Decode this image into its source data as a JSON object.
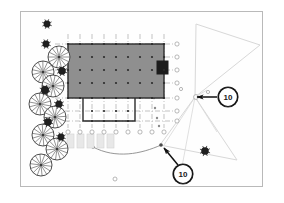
{
  "sheet": {
    "background_color": "#ffffff",
    "frame_border_color": "#b9b9b9",
    "drawing_type": "architectural-site-plan"
  },
  "callouts": [
    {
      "id": "callout-upper",
      "label": "10",
      "cx": 207,
      "cy": 85,
      "radius": 9.5,
      "arrow_from_x": 196,
      "arrow_from_y": 85,
      "arrow_to_x": 176,
      "arrow_to_y": 85,
      "target_x": 172,
      "target_y": 85
    },
    {
      "id": "callout-lower",
      "label": "10",
      "cx": 162,
      "cy": 162,
      "radius": 9.5,
      "arrow_from_x": 157,
      "arrow_from_y": 153,
      "arrow_to_x": 143,
      "arrow_to_y": 136,
      "target_x": 140,
      "target_y": 133
    }
  ],
  "building": {
    "name": "building-footprint",
    "fill_color": "#8f8f8f",
    "stroke_color": "#2b2b2b",
    "x": 47,
    "y": 32,
    "width": 96,
    "height": 54,
    "core": {
      "name": "service-core",
      "x": 136,
      "y": 49,
      "width": 11,
      "height": 13,
      "fill_color": "#1c1c1c"
    },
    "extension": {
      "name": "lower-extension",
      "x": 62,
      "y": 86,
      "width": 52,
      "height": 23,
      "stroke_color": "#2b2b2b"
    }
  },
  "grid": {
    "name": "structural-column-grid",
    "line_color": "#9a9a9a",
    "bubble_stroke_color": "#9a9a9a",
    "bubble_radius": 2.1,
    "vertical_lines_x": [
      47,
      59,
      71,
      83,
      95,
      107,
      119,
      131,
      143
    ],
    "vertical_top_y": 22,
    "vertical_bottom_y": 116,
    "bottom_bubbles_y": 120,
    "horizontal_lines_y": [
      32,
      45,
      58,
      71,
      86,
      99,
      109
    ],
    "horizontal_left_x": 34,
    "horizontal_right_x": 152,
    "right_bubbles_x": 156,
    "column_dot_color": "#2b2b2b",
    "column_dot_radius": 1.1
  },
  "trees": {
    "name": "landscape-tree-symbols",
    "canopy_stroke_color": "#3a3a3a",
    "shrub_fill_color": "#1f1f1f",
    "large": [
      {
        "cx": 38,
        "cy": 45,
        "r": 11
      },
      {
        "cx": 22,
        "cy": 60,
        "r": 11
      },
      {
        "cx": 32,
        "cy": 74,
        "r": 11
      },
      {
        "cx": 19,
        "cy": 92,
        "r": 11
      },
      {
        "cx": 34,
        "cy": 105,
        "r": 11
      },
      {
        "cx": 22,
        "cy": 123,
        "r": 11
      },
      {
        "cx": 36,
        "cy": 137,
        "r": 11
      },
      {
        "cx": 20,
        "cy": 153,
        "r": 11
      }
    ],
    "small": [
      {
        "cx": 26,
        "cy": 12,
        "r": 3.4
      },
      {
        "cx": 25,
        "cy": 32,
        "r": 3.4
      },
      {
        "cx": 41,
        "cy": 59,
        "r": 3.8
      },
      {
        "cx": 24,
        "cy": 78,
        "r": 4.0
      },
      {
        "cx": 38,
        "cy": 92,
        "r": 3.6
      },
      {
        "cx": 27,
        "cy": 110,
        "r": 3.8
      },
      {
        "cx": 40,
        "cy": 125,
        "r": 3.4
      },
      {
        "cx": 184,
        "cy": 139,
        "r": 3.8
      }
    ]
  },
  "site_furniture": {
    "name": "site-furniture-row",
    "fill_color": "#e8e8e8",
    "stroke_color": "#d2d2d2",
    "items": [
      {
        "x": 46,
        "y": 122,
        "width": 7,
        "height": 14
      },
      {
        "x": 56,
        "y": 122,
        "width": 7,
        "height": 14
      },
      {
        "x": 66,
        "y": 122,
        "width": 7,
        "height": 14
      },
      {
        "x": 76,
        "y": 122,
        "width": 7,
        "height": 14
      },
      {
        "x": 86,
        "y": 122,
        "width": 7,
        "height": 14
      }
    ]
  },
  "survey": {
    "name": "survey-boundary-lines",
    "stroke_color": "#d8d8d8",
    "polygon_upper": "175,12 239,33 174,85",
    "polygon_lower": "174,85 216,148 139,133",
    "edge_right_upper": "175,12 239,33",
    "edge_lower_right": "216,148 239,33",
    "guide_lines": [
      "174,85 143,133",
      "174,85 160,160",
      "174,85 196,120",
      "174,85 186,78"
    ]
  },
  "dotted_column": {
    "name": "survey-point-markers",
    "dot_color": "#8b8b8b",
    "dot_radius": 1.2,
    "points": [
      {
        "cx": 136,
        "cy": 56
      },
      {
        "cx": 134,
        "cy": 66
      },
      {
        "cx": 133,
        "cy": 76
      },
      {
        "cx": 133,
        "cy": 86
      },
      {
        "cx": 134,
        "cy": 96
      },
      {
        "cx": 136,
        "cy": 106
      },
      {
        "cx": 138,
        "cy": 114
      }
    ]
  },
  "curve_path": {
    "name": "curved-site-path",
    "stroke_color": "#8a8a8a",
    "path": "M 72,135 C 95,147 120,142 140,133",
    "node_color": "#4a4a4a",
    "nodes": [
      {
        "cx": 72,
        "cy": 135,
        "r": 1.6
      },
      {
        "cx": 140,
        "cy": 133,
        "r": 1.8
      }
    ]
  },
  "misc_markers": {
    "name": "misc-point-markers",
    "stroke_color": "#a5a5a5",
    "points": [
      {
        "cx": 94,
        "cy": 167,
        "r": 2.0
      },
      {
        "cx": 160,
        "cy": 77,
        "r": 1.6
      },
      {
        "cx": 187,
        "cy": 80,
        "r": 1.6
      },
      {
        "cx": 175,
        "cy": 85,
        "r": 2.4
      }
    ]
  }
}
